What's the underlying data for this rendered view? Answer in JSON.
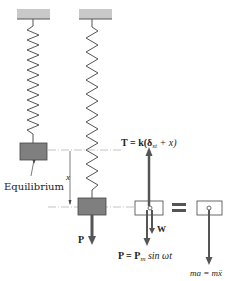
{
  "figure": {
    "labels": {
      "equilibrium": "Equilibrium",
      "displacement": "x",
      "tension": "T = k(δ",
      "tension_sub": "st",
      "tension_tail": " + x)",
      "weight": "W",
      "force_p": "P",
      "force_p_eq": "P = P",
      "force_p_sub": "m",
      "force_p_tail": " sin ωt",
      "inertia": "ma = mẍ",
      "equals": "="
    },
    "colors": {
      "support": "#c9c9c9",
      "spring": "#555555",
      "mass": "#7f7f7f",
      "arrow": "#555555",
      "dashline": "#9a9a9a",
      "text": "#222222"
    }
  }
}
